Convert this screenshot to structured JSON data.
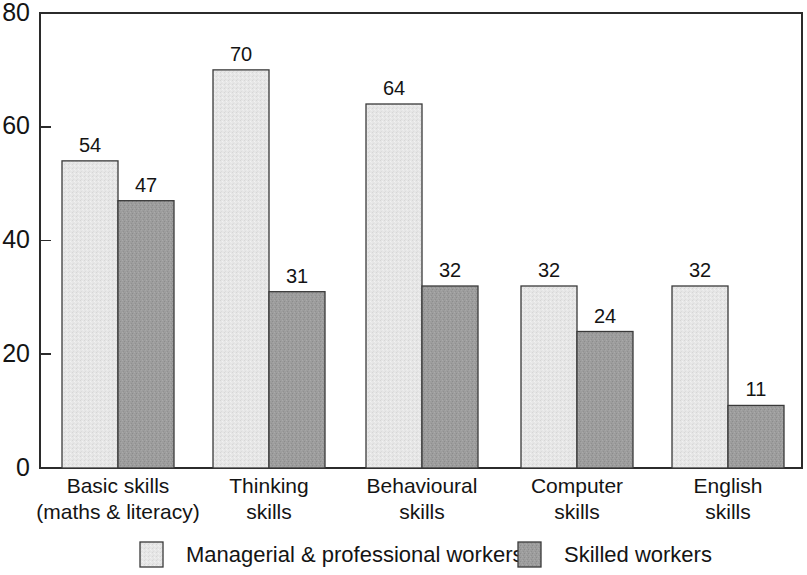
{
  "chart_data": {
    "type": "bar",
    "title": "",
    "subtitle": "",
    "xlabel": "",
    "ylabel": "",
    "ylim": [
      0,
      80
    ],
    "yticks": [
      0,
      20,
      40,
      60,
      80
    ],
    "ytick_labels": [
      "0",
      "20",
      "40",
      "60",
      "80"
    ],
    "grid": false,
    "legend_position": "bottom",
    "value_labels": true,
    "categories": [
      "Basic skills\n(maths & literacy)",
      "Thinking\nskills",
      "Behavioural\nskills",
      "Computer\nskills",
      "English\nskills"
    ],
    "category_lines": [
      [
        "Basic skills",
        "(maths & literacy)"
      ],
      [
        "Thinking",
        "skills"
      ],
      [
        "Behavioural",
        "skills"
      ],
      [
        "Computer",
        "skills"
      ],
      [
        "English",
        "skills"
      ]
    ],
    "series": [
      {
        "name": "Managerial & professional workers",
        "color": "#e3e3e3",
        "values": [
          54,
          70,
          64,
          32,
          32
        ]
      },
      {
        "name": "Skilled workers",
        "color": "#9a9a9a",
        "values": [
          47,
          31,
          32,
          24,
          11
        ]
      }
    ]
  },
  "legend": {
    "items": [
      {
        "label": "Managerial & professional workers",
        "color": "#e3e3e3"
      },
      {
        "label": "Skilled workers",
        "color": "#9a9a9a"
      }
    ]
  },
  "colors": {
    "series_light": "#e3e3e3",
    "series_dark": "#9a9a9a",
    "axis": "#2b2b2b",
    "text": "#141414",
    "background": "#ffffff",
    "bar_border": "#3a3a3a"
  }
}
